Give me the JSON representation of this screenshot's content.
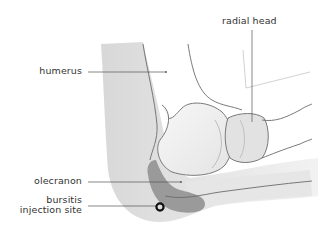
{
  "diagram": {
    "labels": {
      "humerus": "humerus",
      "radial_head": "radial head",
      "olecranon": "olecranon",
      "bursitis_line1": "bursitis",
      "bursitis_line2": "injection site"
    },
    "colors": {
      "outline": "#6b6b6b",
      "leader": "#555555",
      "bone_light": "#eeeeee",
      "skin": "#dcdcdc",
      "bursa": "#9a9a9a",
      "marker": "#111111",
      "text": "#333333"
    }
  }
}
